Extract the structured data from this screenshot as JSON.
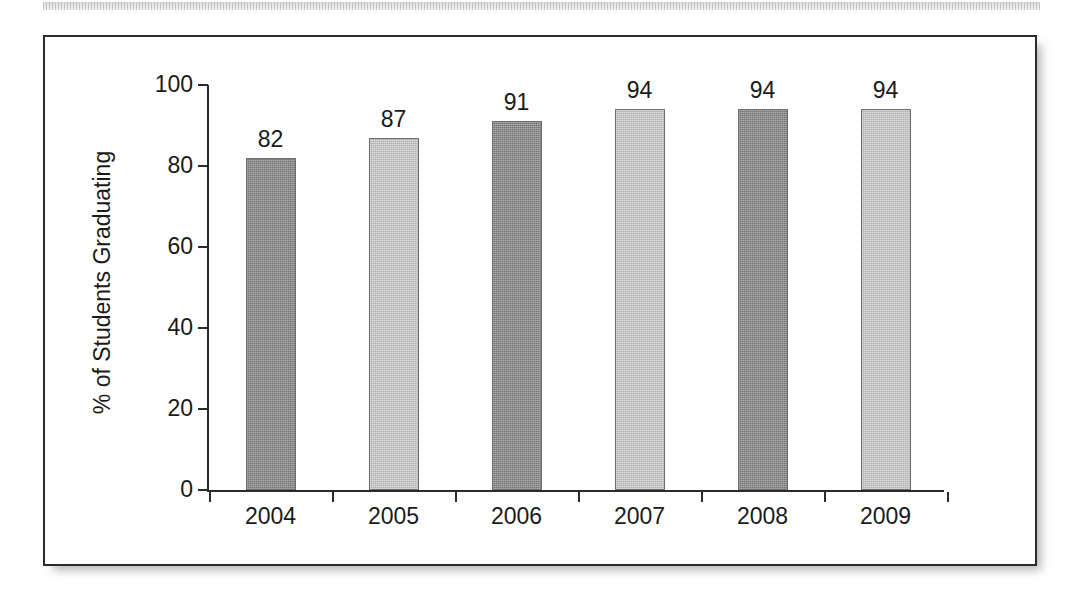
{
  "figure": {
    "background_color": "#ffffff",
    "border_color": "#2b2b2b",
    "artifact_name": "scan-artifact-strip"
  },
  "chart_data": {
    "type": "bar",
    "title": "",
    "xlabel": "",
    "ylabel": "% of Students Graduating",
    "categories": [
      "2004",
      "2005",
      "2006",
      "2007",
      "2008",
      "2009"
    ],
    "values": [
      82,
      87,
      91,
      94,
      94,
      94
    ],
    "value_labels": [
      "82",
      "87",
      "91",
      "94",
      "94",
      "94"
    ],
    "bar_styles": [
      "dark",
      "light",
      "dark",
      "light",
      "dark",
      "light"
    ],
    "bar_colors": {
      "dark": "#8d8d8d",
      "light": "#c8c8c8",
      "outline": "#6d6d6d"
    },
    "ylim": [
      0,
      100
    ],
    "yticks": [
      0,
      20,
      40,
      60,
      80,
      100
    ],
    "ytick_labels": [
      "0",
      "20",
      "40",
      "60",
      "80",
      "100"
    ],
    "grid": false,
    "legend": null,
    "axis_color": "#2b2b2b"
  }
}
